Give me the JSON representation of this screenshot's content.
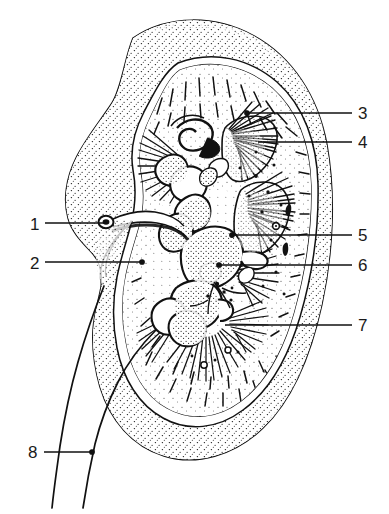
{
  "figure": {
    "kind": "anatomical-line-drawing",
    "caption_fragment": "",
    "ink_color": "#111111",
    "background_color": "#ffffff"
  },
  "labels": [
    {
      "id": "1",
      "text": "1",
      "side": "left",
      "x": 30,
      "y": 216,
      "line_from_x": 45,
      "line_to_x": 105,
      "line_y": 223,
      "terminator": "none"
    },
    {
      "id": "2",
      "text": "2",
      "side": "left",
      "x": 30,
      "y": 255,
      "line_from_x": 45,
      "line_to_x": 142,
      "line_y": 262,
      "terminator": "dot"
    },
    {
      "id": "3",
      "text": "3",
      "side": "right",
      "x": 358,
      "y": 105,
      "line_from_x": 352,
      "line_to_x": 247,
      "line_y": 113,
      "terminator": "dot"
    },
    {
      "id": "4",
      "text": "4",
      "side": "right",
      "x": 358,
      "y": 134,
      "line_from_x": 352,
      "line_to_x": 258,
      "line_y": 142,
      "terminator": "none"
    },
    {
      "id": "5",
      "text": "5",
      "side": "right",
      "x": 358,
      "y": 227,
      "line_from_x": 352,
      "line_to_x": 232,
      "line_y": 235,
      "terminator": "dot"
    },
    {
      "id": "6",
      "text": "6",
      "side": "right",
      "x": 358,
      "y": 257,
      "line_from_x": 352,
      "line_to_x": 219,
      "line_y": 265,
      "terminator": "dot"
    },
    {
      "id": "7",
      "text": "7",
      "side": "right",
      "x": 358,
      "y": 317,
      "line_from_x": 352,
      "line_to_x": 225,
      "line_y": 325,
      "terminator": "none"
    },
    {
      "id": "8",
      "text": "8",
      "side": "left",
      "x": 28,
      "y": 444,
      "line_from_x": 44,
      "line_to_x": 92,
      "line_y": 452,
      "terminator": "dot"
    }
  ]
}
